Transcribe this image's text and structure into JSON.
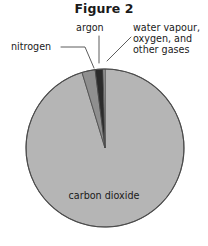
{
  "figure": {
    "title": "Figure 2"
  },
  "labels": {
    "nitrogen": "nitrogen",
    "argon": "argon",
    "other_gases": "water vapour,\noxygen, and\nother gases",
    "carbon_dioxide": "carbon dioxide"
  },
  "colors": {
    "carbon_dioxide": "#b5b5b5",
    "nitrogen": "#8f8f8f",
    "argon": "#2b2b2b",
    "other_gases": "#b5b5b5",
    "outline": "#4a4a4a",
    "leader_line": "#4a4a4a",
    "text": "#1a1a1a",
    "background": "#ffffff"
  },
  "chart_data": {
    "type": "pie",
    "title": "Figure 2",
    "xlabel": "",
    "ylabel": "",
    "legend_position": "callout-labels",
    "grid": false,
    "start_angle_deg": 0,
    "direction": "clockwise",
    "categories": [
      "carbon dioxide",
      "nitrogen",
      "argon",
      "water vapour, oxygen, and other gases"
    ],
    "values": [
      95.3,
      2.7,
      1.6,
      0.4
    ],
    "unit": "percent",
    "slices": [
      {
        "label": "carbon dioxide",
        "value": 95.3,
        "color": "#b5b5b5",
        "label_placement": "inside"
      },
      {
        "label": "nitrogen",
        "value": 2.7,
        "color": "#8f8f8f",
        "label_placement": "callout-left"
      },
      {
        "label": "argon",
        "value": 1.6,
        "color": "#2b2b2b",
        "label_placement": "callout-top"
      },
      {
        "label": "water vapour, oxygen, and other gases",
        "value": 0.4,
        "color": "#b5b5b5",
        "label_placement": "callout-right"
      }
    ]
  },
  "geometry": {
    "center_x": 105,
    "center_y": 148,
    "radius": 79
  }
}
